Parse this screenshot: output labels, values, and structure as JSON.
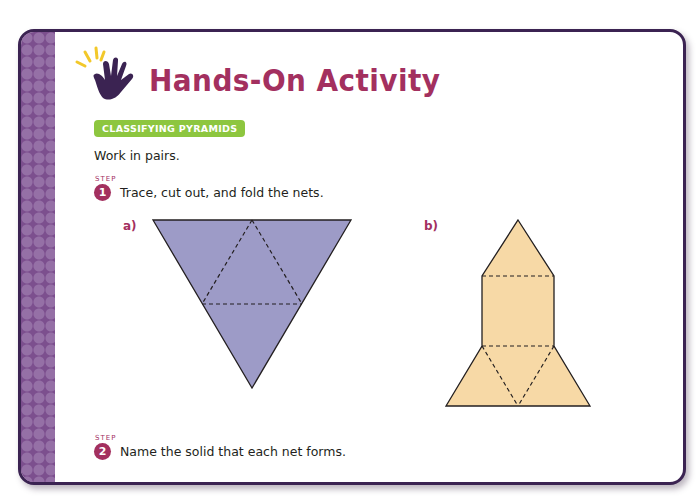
{
  "header": {
    "title": "Hands-On Activity",
    "icon": "waving-hand-icon"
  },
  "section_badge": "CLASSIFYING PYRAMIDS",
  "intro": "Work in pairs.",
  "steps": [
    {
      "word": "STEP",
      "number": "1",
      "text": "Trace, cut out, and fold the nets."
    },
    {
      "word": "STEP",
      "number": "2",
      "text": "Name the solid that each net forms."
    }
  ],
  "nets": [
    {
      "label": "a)",
      "shape": "triangular-pyramid-net",
      "fill": "#9d9bc7"
    },
    {
      "label": "b)",
      "shape": "square-pyramid-partial-net",
      "fill": "#f7d9a6"
    }
  ],
  "colors": {
    "title": "#a3305f",
    "badge": "#8dc63f",
    "strip": "#7c4f8e",
    "border": "#3b2352"
  }
}
